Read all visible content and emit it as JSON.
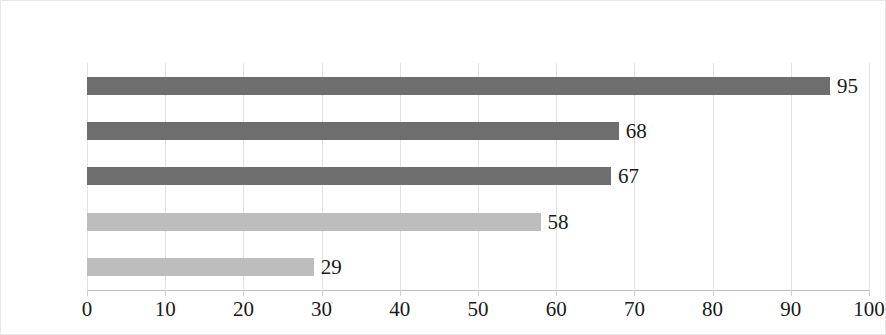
{
  "chart_data": {
    "type": "bar",
    "orientation": "horizontal",
    "title": "",
    "subtitle": "",
    "xlabel": "",
    "ylabel": "",
    "categories": [
      "家人",
      "同事",
      "邻居",
      "上海人",
      "陌生人"
    ],
    "values": [
      95,
      68,
      67,
      58,
      29
    ],
    "data_labels": [
      "95",
      "68",
      "67",
      "58",
      "29"
    ],
    "bar_colors": [
      "#6e6e6e",
      "#6e6e6e",
      "#6e6e6e",
      "#bdbdbd",
      "#bdbdbd"
    ],
    "xlim": [
      0,
      100
    ],
    "xticks": [
      0,
      10,
      20,
      30,
      40,
      50,
      60,
      70,
      80,
      90,
      100
    ],
    "xtick_labels": [
      "0",
      "10",
      "20",
      "30",
      "40",
      "50",
      "60",
      "70",
      "80",
      "90",
      "100"
    ],
    "grid": true,
    "grid_axis": "x",
    "legend": false,
    "legend_position": "none",
    "colors": {
      "bar_dark": "#6e6e6e",
      "bar_light": "#bdbdbd",
      "gridline": "#e2e2e2",
      "axis_line": "#bdbdbd",
      "text": "#1a1a1a",
      "border": "#e8e8e8",
      "background": "#ffffff"
    }
  }
}
